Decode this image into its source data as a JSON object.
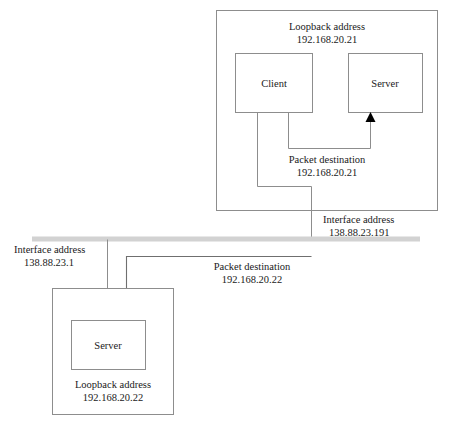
{
  "diagram": {
    "colors": {
      "box_stroke": "#8d8d8d",
      "connector": "#8d8d8d",
      "cable": "#d2d2d2",
      "arrow_fill": "#000000",
      "text": "#1a1a1a",
      "background": "#ffffff"
    },
    "top_host": {
      "caption_line1": "Loopback address",
      "caption_line2": "192.168.20.21",
      "client": {
        "label": "Client"
      },
      "server": {
        "label": "Server"
      },
      "loopback_packet": {
        "caption_line1": "Packet destination",
        "caption_line2": "192.168.20.21"
      },
      "interface": {
        "caption_line1": "Interface address",
        "caption_line2": "138.88.23.191"
      }
    },
    "bottom_host": {
      "server": {
        "label": "Server"
      },
      "caption_line1": "Loopback address",
      "caption_line2": "192.168.20.22",
      "interface": {
        "caption_line1": "Interface address",
        "caption_line2": "138.88.23.1"
      }
    },
    "outbound_packet": {
      "caption_line1": "Packet destination",
      "caption_line2": "192.168.20.22"
    },
    "network_cable": {
      "label": "network-segment"
    }
  }
}
